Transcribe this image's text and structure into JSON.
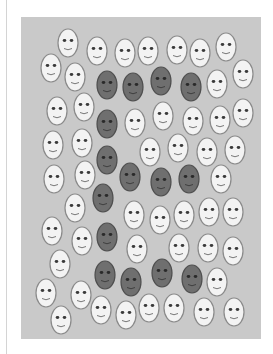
{
  "figure": {
    "background_color": "#ffffff",
    "panel_color": "#c9c9c9",
    "light_face": {
      "fill": "#f3f3f3",
      "stroke": "#8a8a8a"
    },
    "dark_face": {
      "fill": "#6f6f6f",
      "stroke": "#505050"
    },
    "hidden_letter": "E"
  },
  "faces": [
    {
      "x": 68,
      "y": 43,
      "type": "light"
    },
    {
      "x": 97,
      "y": 51,
      "type": "light"
    },
    {
      "x": 125,
      "y": 53,
      "type": "light"
    },
    {
      "x": 148,
      "y": 51,
      "type": "light"
    },
    {
      "x": 177,
      "y": 50,
      "type": "light"
    },
    {
      "x": 200,
      "y": 53,
      "type": "light"
    },
    {
      "x": 226,
      "y": 47,
      "type": "light"
    },
    {
      "x": 51,
      "y": 68,
      "type": "light"
    },
    {
      "x": 75,
      "y": 77,
      "type": "light"
    },
    {
      "x": 107,
      "y": 85,
      "type": "dark"
    },
    {
      "x": 133,
      "y": 87,
      "type": "dark"
    },
    {
      "x": 161,
      "y": 81,
      "type": "dark"
    },
    {
      "x": 191,
      "y": 87,
      "type": "dark"
    },
    {
      "x": 217,
      "y": 84,
      "type": "light"
    },
    {
      "x": 243,
      "y": 74,
      "type": "light"
    },
    {
      "x": 57,
      "y": 111,
      "type": "light"
    },
    {
      "x": 84,
      "y": 107,
      "type": "light"
    },
    {
      "x": 107,
      "y": 124,
      "type": "dark"
    },
    {
      "x": 135,
      "y": 123,
      "type": "light"
    },
    {
      "x": 163,
      "y": 116,
      "type": "light"
    },
    {
      "x": 193,
      "y": 121,
      "type": "light"
    },
    {
      "x": 220,
      "y": 120,
      "type": "light"
    },
    {
      "x": 243,
      "y": 113,
      "type": "light"
    },
    {
      "x": 53,
      "y": 145,
      "type": "light"
    },
    {
      "x": 82,
      "y": 143,
      "type": "light"
    },
    {
      "x": 107,
      "y": 160,
      "type": "dark"
    },
    {
      "x": 150,
      "y": 152,
      "type": "light"
    },
    {
      "x": 178,
      "y": 148,
      "type": "light"
    },
    {
      "x": 207,
      "y": 152,
      "type": "light"
    },
    {
      "x": 235,
      "y": 150,
      "type": "light"
    },
    {
      "x": 54,
      "y": 179,
      "type": "light"
    },
    {
      "x": 85,
      "y": 175,
      "type": "light"
    },
    {
      "x": 130,
      "y": 177,
      "type": "dark"
    },
    {
      "x": 161,
      "y": 182,
      "type": "dark"
    },
    {
      "x": 189,
      "y": 179,
      "type": "dark"
    },
    {
      "x": 221,
      "y": 179,
      "type": "light"
    },
    {
      "x": 75,
      "y": 208,
      "type": "light"
    },
    {
      "x": 103,
      "y": 198,
      "type": "dark"
    },
    {
      "x": 134,
      "y": 215,
      "type": "light"
    },
    {
      "x": 160,
      "y": 220,
      "type": "light"
    },
    {
      "x": 184,
      "y": 215,
      "type": "light"
    },
    {
      "x": 209,
      "y": 212,
      "type": "light"
    },
    {
      "x": 233,
      "y": 212,
      "type": "light"
    },
    {
      "x": 52,
      "y": 231,
      "type": "light"
    },
    {
      "x": 82,
      "y": 241,
      "type": "light"
    },
    {
      "x": 107,
      "y": 237,
      "type": "dark"
    },
    {
      "x": 137,
      "y": 249,
      "type": "light"
    },
    {
      "x": 179,
      "y": 248,
      "type": "light"
    },
    {
      "x": 208,
      "y": 248,
      "type": "light"
    },
    {
      "x": 233,
      "y": 251,
      "type": "light"
    },
    {
      "x": 60,
      "y": 264,
      "type": "light"
    },
    {
      "x": 105,
      "y": 275,
      "type": "dark"
    },
    {
      "x": 131,
      "y": 282,
      "type": "dark"
    },
    {
      "x": 162,
      "y": 273,
      "type": "dark"
    },
    {
      "x": 192,
      "y": 279,
      "type": "dark"
    },
    {
      "x": 217,
      "y": 282,
      "type": "light"
    },
    {
      "x": 46,
      "y": 293,
      "type": "light"
    },
    {
      "x": 81,
      "y": 295,
      "type": "light"
    },
    {
      "x": 101,
      "y": 310,
      "type": "light"
    },
    {
      "x": 126,
      "y": 315,
      "type": "light"
    },
    {
      "x": 149,
      "y": 308,
      "type": "light"
    },
    {
      "x": 174,
      "y": 308,
      "type": "light"
    },
    {
      "x": 204,
      "y": 312,
      "type": "light"
    },
    {
      "x": 234,
      "y": 312,
      "type": "light"
    },
    {
      "x": 61,
      "y": 320,
      "type": "light"
    }
  ]
}
